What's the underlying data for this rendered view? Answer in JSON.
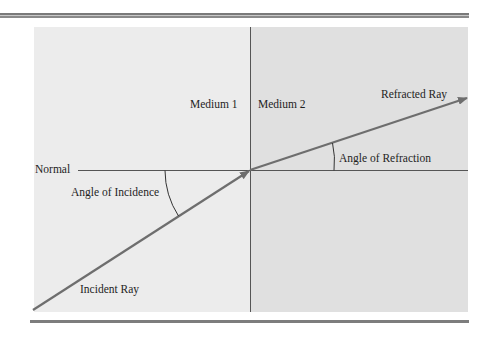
{
  "diagram": {
    "labels": {
      "medium_1": "Medium 1",
      "medium_2": "Medium 2",
      "normal": "Normal",
      "angle_of_incidence": "Angle of Incidence",
      "angle_of_refraction": "Angle of Refraction",
      "refracted_ray": "Refracted Ray",
      "incident_ray": "Incident Ray"
    },
    "colors": {
      "medium_1_fill": "#ececec",
      "medium_2_fill": "#e0e0e0",
      "ray_color": "#6e6e6e",
      "line_color": "#4a4a4a"
    },
    "geometry": {
      "intersection": [
        250,
        170
      ],
      "incident_ray_start": [
        33,
        310
      ],
      "refracted_ray_end": [
        468,
        98
      ]
    }
  }
}
